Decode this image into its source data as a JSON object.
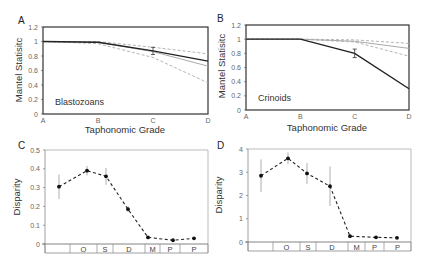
{
  "chart_data": [
    {
      "panel": "A",
      "type": "line",
      "title": "Blastozoans",
      "xlabel": "Taphonomic Grade",
      "ylabel": "Mantel Statisitc",
      "categories": [
        "A",
        "B",
        "C",
        "D"
      ],
      "yticks": [
        "0",
        "0.2",
        "0.4",
        "0.6",
        "0.8",
        "1",
        "1.2"
      ],
      "ylim": [
        0,
        1.2
      ],
      "series": [
        {
          "name": "observed",
          "style": "solid-black",
          "values": [
            1.0,
            0.99,
            0.87,
            0.73
          ],
          "error_at": "C",
          "error": 0.05
        },
        {
          "name": "model-mean",
          "style": "solid-gray",
          "values": [
            1.0,
            0.99,
            0.86,
            0.66
          ]
        },
        {
          "name": "upper-bound",
          "style": "dashed-gray",
          "values": [
            1.0,
            1.0,
            0.92,
            0.83
          ]
        },
        {
          "name": "lower-bound",
          "style": "dashed-gray",
          "values": [
            1.0,
            0.97,
            0.78,
            0.43
          ]
        }
      ]
    },
    {
      "panel": "B",
      "type": "line",
      "title": "Crinoids",
      "xlabel": "Taphonomic Grade",
      "ylabel": "Mantel Statisitc",
      "categories": [
        "A",
        "B",
        "C",
        "D"
      ],
      "yticks": [
        "0",
        "0.2",
        "0.4",
        "0.6",
        "0.8",
        "1",
        "1.2"
      ],
      "ylim": [
        0,
        1.2
      ],
      "series": [
        {
          "name": "observed",
          "style": "solid-black",
          "values": [
            1.0,
            1.0,
            0.8,
            0.3
          ],
          "error_at": "C",
          "error": 0.06
        },
        {
          "name": "model-mean",
          "style": "solid-gray",
          "values": [
            1.0,
            1.0,
            0.97,
            0.87
          ]
        },
        {
          "name": "upper-bound",
          "style": "dashed-gray",
          "values": [
            1.0,
            1.0,
            0.99,
            0.94
          ]
        },
        {
          "name": "lower-bound",
          "style": "dashed-gray",
          "values": [
            1.0,
            1.0,
            0.96,
            0.76
          ]
        }
      ]
    },
    {
      "panel": "C",
      "type": "line",
      "xlabel": "",
      "ylabel": "Disparity",
      "categories": [
        "",
        "O",
        "S",
        "D",
        "M",
        "P",
        "P"
      ],
      "yticks": [
        "0",
        "0.1",
        "0.2",
        "0.3",
        "0.4",
        "0.5"
      ],
      "ylim": [
        0,
        0.5
      ],
      "series": [
        {
          "name": "disparity",
          "style": "dashed-black-markers",
          "values": [
            0.305,
            0.39,
            0.36,
            0.185,
            0.035,
            0.02,
            0.03
          ],
          "errors": [
            0.065,
            0.025,
            0.045,
            0.015,
            0.008,
            0.005,
            0.006
          ]
        }
      ]
    },
    {
      "panel": "D",
      "type": "line",
      "xlabel": "",
      "ylabel": "Disparity",
      "categories": [
        "",
        "O",
        "S",
        "D",
        "M",
        "P",
        "P"
      ],
      "yticks": [
        "0",
        "1",
        "2",
        "3",
        "4"
      ],
      "ylim": [
        0,
        4
      ],
      "series": [
        {
          "name": "disparity",
          "style": "dashed-black-markers",
          "values": [
            2.85,
            3.6,
            2.95,
            2.4,
            0.25,
            0.2,
            0.18
          ],
          "errors": [
            0.7,
            0.25,
            0.45,
            0.85,
            0.08,
            0.05,
            0.05
          ]
        }
      ]
    }
  ],
  "panels": {
    "A": {
      "letter": "A",
      "name": "Blastozoans",
      "xlabel": "Taphonomic Grade",
      "ylabel": "Mantel Statisitc"
    },
    "B": {
      "letter": "B",
      "name": "Crinoids",
      "xlabel": "Taphonomic Grade",
      "ylabel": "Mantel Statisitc"
    },
    "C": {
      "letter": "C",
      "ylabel": "Disparity"
    },
    "D": {
      "letter": "D",
      "ylabel": "Disparity"
    }
  },
  "colors": {
    "black_line": "#222222",
    "gray_line": "#aaaaaa",
    "dashed": "#b0b0b0",
    "axis": "#444444"
  }
}
